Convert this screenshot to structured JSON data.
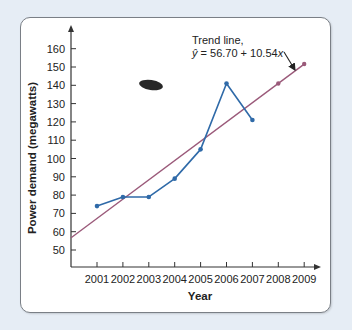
{
  "chart_data": {
    "type": "line",
    "title": "",
    "xlabel": "Year",
    "ylabel": "Power demand (megawatts)",
    "x": [
      "2001",
      "2002",
      "2003",
      "2004",
      "2005",
      "2006",
      "2007",
      "2008",
      "2009"
    ],
    "yticks": [
      50,
      60,
      70,
      80,
      90,
      100,
      110,
      120,
      130,
      140,
      150,
      160
    ],
    "ylim": [
      42,
      170
    ],
    "grid": false,
    "series": [
      {
        "name": "Actual power demand",
        "color": "#2f6aa8",
        "x": [
          "2001",
          "2002",
          "2003",
          "2004",
          "2005",
          "2006",
          "2007"
        ],
        "values": [
          74,
          79,
          79,
          89,
          105,
          141,
          121
        ]
      },
      {
        "name": "Trend line",
        "color": "#9b5a7a",
        "equation": "ŷ = 56.70 + 10.54x",
        "intercept": 56.7,
        "slope": 10.54,
        "forecast_points": [
          {
            "x": "2008",
            "value": 141.0
          },
          {
            "x": "2009",
            "value": 151.6
          }
        ]
      }
    ],
    "annotations": [
      {
        "text_line1": "Trend line,",
        "text_line2": "ŷ = 56.70 + 10.54x",
        "points_to": "trend line near 2009"
      }
    ]
  },
  "labels": {
    "ylabel": "Power demand (megawatts)",
    "xlabel": "Year",
    "annotation_line1": "Trend line,",
    "annotation_yhat": "ŷ",
    "annotation_eq": " = 56.70 + 10.54",
    "annotation_x": "x"
  },
  "colors": {
    "actual": "#2f6aa8",
    "trend": "#9b5a7a",
    "axis": "#333333",
    "panel_bg": "#ffffff",
    "page_bg": "#e6edf5"
  }
}
